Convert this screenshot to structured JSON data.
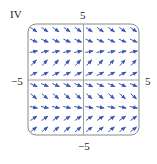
{
  "figure": {
    "panel_label": "IV",
    "x_min_label": "−5",
    "x_max_label": "5",
    "y_max_label": "5",
    "y_min_label": "−5"
  },
  "colors": {
    "arrow": "#3b56b5",
    "axis": "#888888",
    "frame": "#888888"
  },
  "chart_data": {
    "type": "vector_field",
    "title": "IV",
    "xlim": [
      -5,
      5
    ],
    "ylim": [
      -5,
      5
    ],
    "grid_points_per_axis": 10,
    "row_directions_top_to_bottom": [
      {
        "dx": 1,
        "dy": -0.7
      },
      {
        "dx": 1,
        "dy": -0.45
      },
      {
        "dx": 1,
        "dy": 0.2
      },
      {
        "dx": 1,
        "dy": 1.1
      },
      {
        "dx": 1,
        "dy": 0.5
      },
      {
        "dx": 1,
        "dy": -0.45
      },
      {
        "dx": 1,
        "dy": -0.9
      },
      {
        "dx": 1,
        "dy": -0.2
      },
      {
        "dx": 1,
        "dy": 0.7
      },
      {
        "dx": 1,
        "dy": 0.8
      }
    ],
    "note": "Arrow direction depends only on y; same across each row."
  }
}
